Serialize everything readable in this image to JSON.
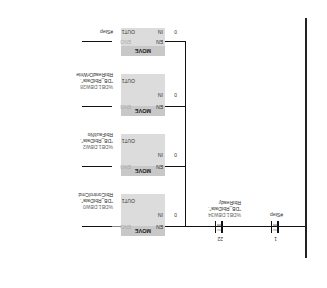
{
  "network": {
    "contacts": [
      {
        "operand_top": "1",
        "compare": "==",
        "type": "Int",
        "operand": "#Step"
      },
      {
        "operand_top": "22",
        "compare": "==",
        "type": "Int",
        "address": "%DB1.DBW34",
        "db": "\"DB_RbtData\".",
        "tag": "RbtReady"
      }
    ],
    "moves": [
      {
        "title": "MOVE",
        "en": "EN",
        "eno": "ENO",
        "in_label": "IN",
        "in_value": "0",
        "out_label": "OUT1",
        "address": "%DB1.DBW0",
        "db": "\"DB_RbtData\".",
        "tag": "RbtControlCmd"
      },
      {
        "title": "MOVE",
        "en": "EN",
        "eno": "ENO",
        "in_label": "IN",
        "in_value": "0",
        "out_label": "OUT1",
        "address": "%DB1.DBW2",
        "db": "\"DB_RbtData\".",
        "tag": "RbtFaultNo"
      },
      {
        "title": "MOVE",
        "en": "EN",
        "eno": "ENO",
        "in_label": "IN",
        "in_value": "0",
        "out_label": "OUT1",
        "address": "%DB1.DBW28",
        "db": "\"DB_RbtData\".",
        "tag": "RbtReadOrWrite"
      },
      {
        "title": "MOVE",
        "en": "EN",
        "eno": "ENO",
        "in_label": "IN",
        "in_value": "0",
        "out_label": "OUT1",
        "tag": "#Step"
      }
    ]
  }
}
